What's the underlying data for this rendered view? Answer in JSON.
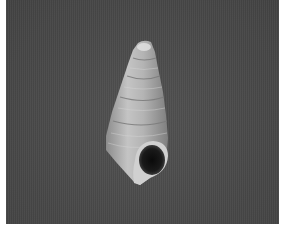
{
  "image": {
    "subject": "Turreted gastropod shell photographed with aperture facing viewer",
    "background_color": "#4b4b4b",
    "shell_color_light": "#d8d8d8",
    "shell_color_mid": "#a8a8a8",
    "aperture_color": "#121212",
    "border_color": "#ffffff"
  }
}
